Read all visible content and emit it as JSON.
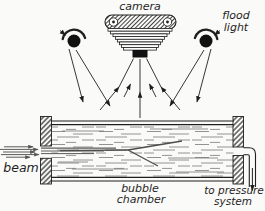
{
  "labels": {
    "camera": "camera",
    "flood_light_line1": "flood",
    "flood_light_line2": "light",
    "beam": "beam",
    "bubble_chamber_line1": "bubble",
    "bubble_chamber_line2": "chamber",
    "pressure_line1": "to pressure",
    "pressure_line2": "system"
  },
  "colors": {
    "ink": "#1f1f1f",
    "track": "#4d4d4d",
    "beam_ray": "#5a5a5a",
    "liquid_dash": "#777777",
    "paper": "#fafaf8"
  }
}
